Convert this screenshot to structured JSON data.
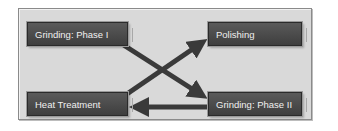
{
  "diagram": {
    "nodes": [
      {
        "id": "grinding-1",
        "label": "Grinding: Phase I"
      },
      {
        "id": "polishing",
        "label": "Polishing"
      },
      {
        "id": "heat-treatment",
        "label": "Heat Treatment"
      },
      {
        "id": "grinding-2",
        "label": "Grinding: Phase II"
      }
    ],
    "edges": [
      {
        "from": "Grinding: Phase I",
        "to": "Grinding: Phase II"
      },
      {
        "from": "Heat Treatment",
        "to": "Polishing"
      },
      {
        "from": "Grinding: Phase II",
        "to": "Heat Treatment"
      }
    ],
    "colors": {
      "background": "#d9d9d9",
      "node_fill": "#4a4a4a",
      "node_text": "#f0f0f0",
      "arrow": "#3a3a3a"
    }
  }
}
